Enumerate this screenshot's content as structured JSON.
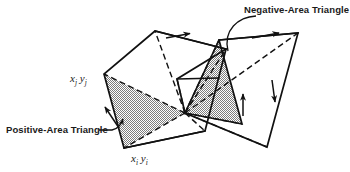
{
  "figure": {
    "background": "#ffffff",
    "ink": "#111111",
    "shade_fill": "#a9a9a9",
    "callouts": {
      "negative": "Negative-Area Triangle",
      "positive": "Positive-Area Triangle"
    },
    "vertices": {
      "j_x": "x",
      "j_xsub": "j",
      "j_y": "y",
      "j_ysub": "j",
      "i_x": "x",
      "i_xsub": "i",
      "i_y": "y",
      "i_ysub": "i"
    },
    "geometry": {
      "fan_origin": [
        185,
        113
      ],
      "outline_solid": "M155,31 L104,74 L124,148 L205,131 L267,147 L298,33 L219,40 L177,79 L185,113 L242,124 L226,49 L155,31",
      "positive_triangle": "M104,74 L124,148 L185,113 Z",
      "negative_triangle": "M219,40 L242,124 L185,113 Z",
      "dashed_fans": [
        "M185,113 L155,31",
        "M185,113 L104,74",
        "M185,113 L124,148",
        "M185,113 L267,147",
        "M185,113 L298,33",
        "M185,113 L226,49",
        "M185,113 L177,79",
        "M185,113 L205,131",
        "M185,113 L219,40",
        "M185,113 L242,124"
      ],
      "arrows": [
        {
          "name": "arrow-top-left-edge",
          "d": "M166,38 L192,33",
          "dir": "right"
        },
        {
          "name": "arrow-left-edge",
          "d": "M119,128 L104,106",
          "dir": "up-left"
        },
        {
          "name": "arrow-negative-up",
          "d": "M243,115 L243,92",
          "dir": "up"
        },
        {
          "name": "arrow-right-down",
          "d": "M272,80 L275,103",
          "dir": "down"
        },
        {
          "name": "arrow-top-right-edge",
          "d": "M252,38 L281,33",
          "dir": "right"
        }
      ],
      "leader_negative": "M257,16 C240,18 225,30 228,50",
      "leader_positive": "M101,130 C110,130 117,127 121,120"
    }
  }
}
